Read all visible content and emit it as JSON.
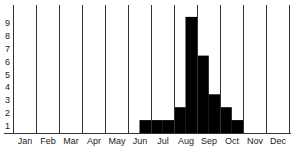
{
  "chart_data": {
    "type": "bar",
    "title": "",
    "xlabel": "",
    "ylabel": "",
    "categories": [
      "Jan",
      "Feb",
      "Mar",
      "Apr",
      "May",
      "Jun",
      "Jul",
      "Aug",
      "Sep",
      "Oct",
      "Nov",
      "Dec"
    ],
    "bin_resolution": "half-month",
    "half_month_values": [
      [
        0,
        0
      ],
      [
        0,
        0
      ],
      [
        0,
        0
      ],
      [
        0,
        0
      ],
      [
        0,
        0
      ],
      [
        0,
        1
      ],
      [
        1,
        1
      ],
      [
        2,
        9
      ],
      [
        6,
        3
      ],
      [
        2,
        1
      ],
      [
        0,
        0
      ],
      [
        0,
        0
      ]
    ],
    "y_ticks": [
      "1",
      "2",
      "3",
      "4",
      "5",
      "6",
      "7",
      "8",
      "9"
    ],
    "ylim": [
      0,
      10
    ],
    "grid": {
      "vertical_month_separators": true,
      "horizontal": false
    },
    "legend": null,
    "colors": {
      "bar": "#000000",
      "lines": "#333333",
      "background": "#ffffff"
    }
  }
}
